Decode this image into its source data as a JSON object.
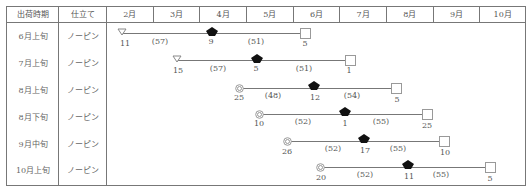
{
  "table": {
    "headers": {
      "period": "出荷時期",
      "method": "仕立て",
      "months": [
        "2月",
        "3月",
        "4月",
        "5月",
        "6月",
        "7月",
        "8月",
        "9月",
        "10月"
      ]
    },
    "rows": [
      {
        "period": "6月上旬",
        "method": "ノーピン",
        "start_marker": "triangle-down",
        "start": "11",
        "gap1": "(57)",
        "mid": "9",
        "gap2": "(51)",
        "end": "5"
      },
      {
        "period": "7月上旬",
        "method": "ノーピン",
        "start_marker": "triangle-down",
        "start": "15",
        "gap1": "(57)",
        "mid": "5",
        "gap2": "(51)",
        "end": "1"
      },
      {
        "period": "8月上旬",
        "method": "ノーピン",
        "start_marker": "double-circle",
        "start": "25",
        "gap1": "(48)",
        "mid": "12",
        "gap2": "(54)",
        "end": "5"
      },
      {
        "period": "8月下旬",
        "method": "ノーピン",
        "start_marker": "double-circle",
        "start": "10",
        "gap1": "(52)",
        "mid": "1",
        "gap2": "(55)",
        "end": "25"
      },
      {
        "period": "9月中旬",
        "method": "ノーピン",
        "start_marker": "double-circle",
        "start": "26",
        "gap1": "(52)",
        "mid": "17",
        "gap2": "(55)",
        "end": "10"
      },
      {
        "period": "10月上旬",
        "method": "ノーピン",
        "start_marker": "double-circle",
        "start": "20",
        "gap1": "(52)",
        "mid": "11",
        "gap2": "(55)",
        "end": "5"
      }
    ]
  },
  "icons": {
    "start_sowing": "triangle-down-icon",
    "start_alt": "double-circle-icon",
    "planting": "filled-diamond-icon",
    "harvest": "square-icon"
  },
  "colors": {
    "line": "#777777",
    "marker_fill": "#111111",
    "marker_outline": "#888888"
  }
}
